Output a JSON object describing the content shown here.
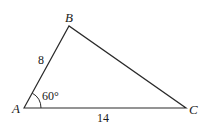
{
  "diagram": {
    "type": "triangle",
    "vertices": {
      "A": {
        "label": "A",
        "x": 24,
        "y": 108
      },
      "B": {
        "label": "B",
        "x": 69,
        "y": 26
      },
      "C": {
        "label": "C",
        "x": 186,
        "y": 108
      }
    },
    "sides": {
      "AB": {
        "label": "8"
      },
      "AC": {
        "label": "14"
      }
    },
    "angles": {
      "A": {
        "label": "60°"
      }
    },
    "colors": {
      "stroke": "#2a2a2a",
      "text": "#1a1a1a",
      "background": "#ffffff"
    }
  }
}
